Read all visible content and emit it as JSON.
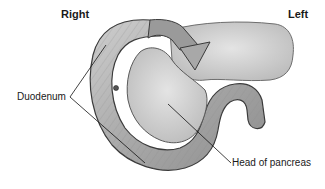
{
  "diagram": {
    "orientation": {
      "right_label": "Right",
      "left_label": "Left"
    },
    "labels": {
      "duodenum": "Duodenum",
      "head_of_pancreas": "Head of pancreas"
    },
    "colors": {
      "tissue_light": "#d6d6d6",
      "tissue_mid": "#b0b0b0",
      "tissue_dark": "#6e6e6e",
      "outline": "#3a3a3a",
      "leader_line": "#111111",
      "text": "#1a1a1a"
    }
  }
}
